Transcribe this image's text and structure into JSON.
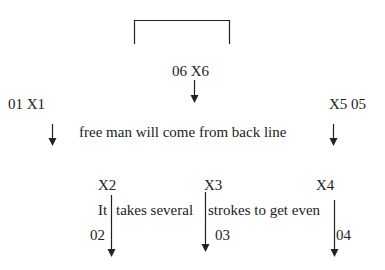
{
  "diagram": {
    "type": "play-diagram",
    "colors": {
      "line": "#222222",
      "text": "#222222",
      "background": "#ffffff"
    },
    "goal": {
      "shape": "bracket",
      "x1": 134,
      "x2": 229,
      "y_top": 20,
      "y_bottom": 44
    },
    "players": [
      {
        "id": "X1",
        "number": "01",
        "label": "01 X1"
      },
      {
        "id": "X2",
        "number": "02",
        "label": "X2"
      },
      {
        "id": "X3",
        "number": "03",
        "label": "X3"
      },
      {
        "id": "X4",
        "number": "04",
        "label": "X4"
      },
      {
        "id": "X5",
        "number": "05",
        "label": "X5 05"
      },
      {
        "id": "X6",
        "number": "06",
        "label": "06 X6"
      }
    ],
    "numbers": {
      "n02": "02",
      "n03": "03",
      "n04": "04"
    },
    "captions": {
      "top_line": "free man will come from back line",
      "bottom_part1": "It",
      "bottom_part2": "takes several",
      "bottom_part3": "strokes to get even"
    },
    "arrows": [
      {
        "player": "X6",
        "x": 194,
        "y1": 80,
        "y2": 103,
        "direction": "down"
      },
      {
        "player": "X1",
        "x": 52,
        "y1": 124,
        "y2": 146,
        "direction": "down"
      },
      {
        "player": "X5",
        "x": 333,
        "y1": 124,
        "y2": 146,
        "direction": "down"
      },
      {
        "player": "X2",
        "x": 111,
        "y1": 195,
        "y2": 257,
        "direction": "down"
      },
      {
        "player": "X3",
        "x": 205,
        "y1": 192,
        "y2": 252,
        "direction": "down"
      },
      {
        "player": "X4",
        "x": 334,
        "y1": 200,
        "y2": 257,
        "direction": "down"
      }
    ]
  }
}
